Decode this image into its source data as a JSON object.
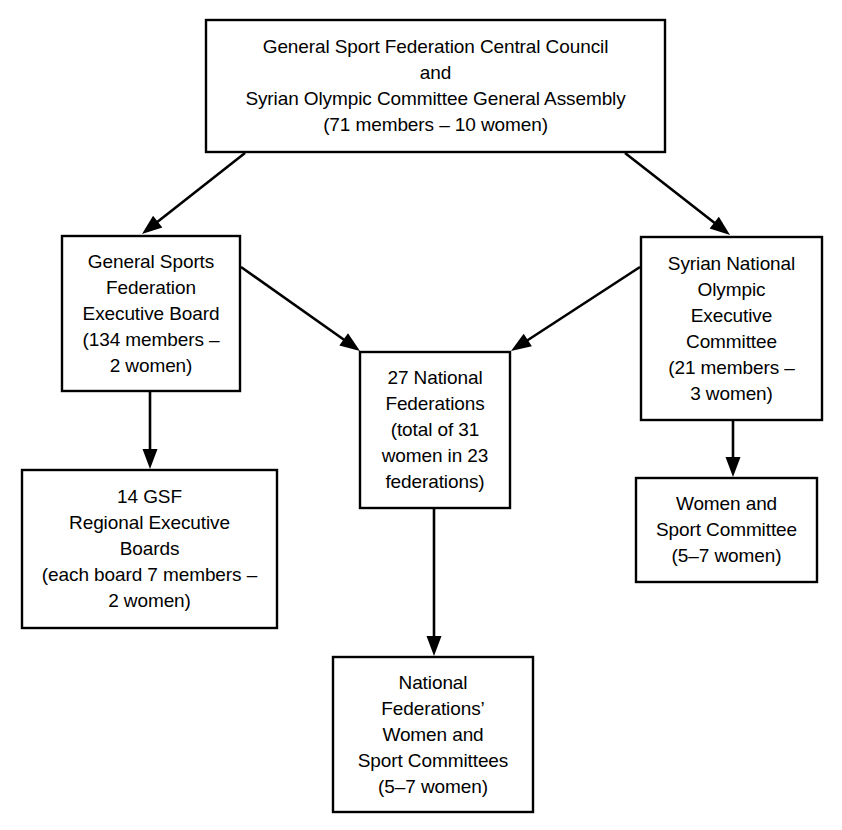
{
  "chart_data": {
    "type": "diagram",
    "subtype": "organizational-hierarchy-flowchart",
    "orientation": "top-down",
    "background_color": "#ffffff",
    "line_color": "#000000",
    "text_color": "#000000",
    "nodes": [
      {
        "id": "central-council",
        "lines": [
          "General Sport Federation Central Council",
          "and",
          "Syrian Olympic Committee General Assembly",
          "(71 members – 10 women)"
        ],
        "x": 206,
        "y": 20,
        "w": 459,
        "h": 132
      },
      {
        "id": "gsf-executive-board",
        "lines": [
          "General Sports",
          "Federation",
          "Executive Board",
          "(134 members –",
          "2 women)"
        ],
        "x": 62,
        "y": 236,
        "w": 178,
        "h": 155
      },
      {
        "id": "national-federations",
        "lines": [
          "27 National",
          "Federations",
          "(total of 31",
          "women in 23",
          "federations)"
        ],
        "x": 360,
        "y": 352,
        "w": 150,
        "h": 156
      },
      {
        "id": "syrian-olympic-executive",
        "lines": [
          "Syrian National",
          "Olympic",
          "Executive",
          "Committee",
          "(21 members –",
          "3 women)"
        ],
        "x": 641,
        "y": 237,
        "w": 181,
        "h": 183
      },
      {
        "id": "gsf-regional-boards",
        "lines": [
          "14 GSF",
          "Regional Executive",
          "Boards",
          "(each board 7 members –",
          "2 women)"
        ],
        "x": 22,
        "y": 470,
        "w": 255,
        "h": 158
      },
      {
        "id": "women-sport-committee",
        "lines": [
          "Women and",
          "Sport Committee",
          "(5–7 women)"
        ],
        "x": 636,
        "y": 478,
        "w": 181,
        "h": 104
      },
      {
        "id": "nf-women-sport-committees",
        "lines": [
          "National",
          "Federations’",
          "Women and",
          "Sport Committees",
          "(5–7 women)"
        ],
        "x": 333,
        "y": 657,
        "w": 200,
        "h": 155
      }
    ],
    "edges": [
      {
        "id": "edge-council-to-gsf",
        "from": "central-council",
        "to": "gsf-executive-board",
        "x1": 245,
        "y1": 153,
        "x2": 142,
        "y2": 234,
        "style": "solid-arrow"
      },
      {
        "id": "edge-council-to-olympic",
        "from": "central-council",
        "to": "syrian-olympic-executive",
        "x1": 625,
        "y1": 153,
        "x2": 730,
        "y2": 235,
        "style": "solid-arrow"
      },
      {
        "id": "edge-gsf-to-federations",
        "from": "gsf-executive-board",
        "to": "national-federations",
        "x1": 241,
        "y1": 267,
        "x2": 360,
        "y2": 351,
        "style": "solid-arrow"
      },
      {
        "id": "edge-olympic-to-federations",
        "from": "syrian-olympic-executive",
        "to": "national-federations",
        "x1": 640,
        "y1": 267,
        "x2": 511,
        "y2": 351,
        "style": "solid-arrow"
      },
      {
        "id": "edge-gsf-to-regional",
        "from": "gsf-executive-board",
        "to": "gsf-regional-boards",
        "x1": 150,
        "y1": 392,
        "x2": 150,
        "y2": 469,
        "style": "solid-arrow"
      },
      {
        "id": "edge-olympic-to-women-sport",
        "from": "syrian-olympic-executive",
        "to": "women-sport-committee",
        "x1": 733,
        "y1": 421,
        "x2": 733,
        "y2": 477,
        "style": "solid-arrow"
      },
      {
        "id": "edge-federations-to-nf-committees",
        "from": "national-federations",
        "to": "nf-women-sport-committees",
        "x1": 434,
        "y1": 509,
        "x2": 434,
        "y2": 656,
        "style": "solid-arrow"
      }
    ]
  }
}
